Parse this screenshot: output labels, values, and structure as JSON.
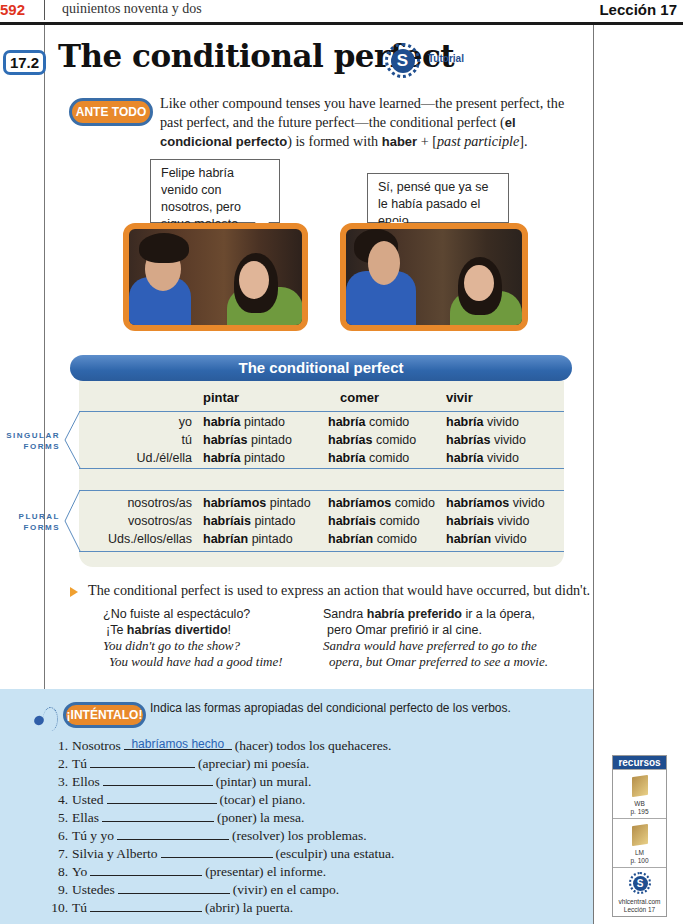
{
  "header": {
    "page_number": "592",
    "page_words": "quinientos noventa y dos",
    "lesson": "Lección 17"
  },
  "section": {
    "number": "17.2",
    "title": "The conditional perfect",
    "tutorial_icon": "S",
    "tutorial_label": "Tutorial"
  },
  "intro": {
    "badge": "ANTE TODO",
    "text_1": "Like other compound tenses you have learned—the present perfect, the past perfect, and the future perfect—the conditional perfect (",
    "bold_1": "el condicional perfecto",
    "text_2": ") is formed with ",
    "bold_2": "haber",
    "text_3": " + [",
    "italic_1": "past participle",
    "text_4": "]."
  },
  "bubbles": [
    {
      "text": "Felipe habría venido con nosotros, pero sigue molesto."
    },
    {
      "text": "Sí, pensé que ya se le había pasado el enojo."
    }
  ],
  "table": {
    "title": "The conditional perfect",
    "columns": [
      "pintar",
      "comer",
      "vivir"
    ],
    "singular_label_1": "SINGULAR",
    "singular_label_2": "FORMS",
    "plural_label_1": "PLURAL",
    "plural_label_2": "FORMS",
    "singular": [
      {
        "pronoun": "yo",
        "aux": "habría",
        "cells": [
          "pintado",
          "comido",
          "vivido"
        ]
      },
      {
        "pronoun": "tú",
        "aux": "habrías",
        "cells": [
          "pintado",
          "comido",
          "vivido"
        ]
      },
      {
        "pronoun": "Ud./él/ella",
        "aux": "habría",
        "cells": [
          "pintado",
          "comido",
          "vivido"
        ]
      }
    ],
    "plural": [
      {
        "pronoun": "nosotros/as",
        "aux": "habríamos",
        "cells": [
          "pintado",
          "comido",
          "vivido"
        ]
      },
      {
        "pronoun": "vosotros/as",
        "aux": "habríais",
        "cells": [
          "pintado",
          "comido",
          "vivido"
        ]
      },
      {
        "pronoun": "Uds./ellos/ellas",
        "aux": "habrían",
        "cells": [
          "pintado",
          "comido",
          "vivido"
        ]
      }
    ]
  },
  "explanation": {
    "text": "The conditional perfect is used to express an action that would have occurred, but didn't.",
    "example_left": {
      "line1": "¿No fuiste al espectáculo?",
      "line2_pre": "¡Te ",
      "line2_bold": "habrías divertido",
      "line2_post": "!",
      "en1": "You didn't go to the show?",
      "en2": "You would have had a good time!"
    },
    "example_right": {
      "line1_pre": "Sandra ",
      "line1_bold": "habría preferido",
      "line1_post": " ir a la ópera,",
      "line2": "pero Omar prefirió ir al cine.",
      "en1": "Sandra would have preferred to go to the",
      "en2": "opera, but Omar preferred to see a movie."
    }
  },
  "exercise": {
    "badge": "¡INTÉNTALO!",
    "instructions": "Indica las formas apropiadas del condicional perfecto de los verbos.",
    "items": [
      {
        "num": "1.",
        "subject": "Nosotros",
        "answer": "habríamos hecho",
        "rest": "(hacer) todos los quehaceres."
      },
      {
        "num": "2.",
        "subject": "Tú",
        "answer": "",
        "rest": "(apreciar) mi poesía."
      },
      {
        "num": "3.",
        "subject": "Ellos",
        "answer": "",
        "rest": "(pintar) un mural."
      },
      {
        "num": "4.",
        "subject": "Usted",
        "answer": "",
        "rest": "(tocar) el piano."
      },
      {
        "num": "5.",
        "subject": "Ellas",
        "answer": "",
        "rest": "(poner) la mesa."
      },
      {
        "num": "6.",
        "subject": "Tú y yo",
        "answer": "",
        "rest": "(resolver) los problemas."
      },
      {
        "num": "7.",
        "subject": "Silvia y Alberto",
        "answer": "",
        "rest": "(esculpir) una estatua."
      },
      {
        "num": "8.",
        "subject": "Yo",
        "answer": "",
        "rest": "(presentar) el informe."
      },
      {
        "num": "9.",
        "subject": "Ustedes",
        "answer": "",
        "rest": "(vivir) en el campo."
      },
      {
        "num": "10.",
        "subject": "Tú",
        "answer": "",
        "rest": "(abrir) la puerta."
      }
    ]
  },
  "recursos": {
    "title": "recursos",
    "items": [
      {
        "label": "WB",
        "page": "p. 195"
      },
      {
        "label": "LM",
        "page": "p. 100"
      },
      {
        "label": "vhlcentral.com",
        "page": "Lección 17"
      }
    ]
  },
  "colors": {
    "accent_blue": "#2f66ab",
    "accent_orange": "#e8892b",
    "page_number_red": "#e0341e",
    "exercise_bg": "#c9e3f3",
    "table_bg": "#eeefe4"
  }
}
